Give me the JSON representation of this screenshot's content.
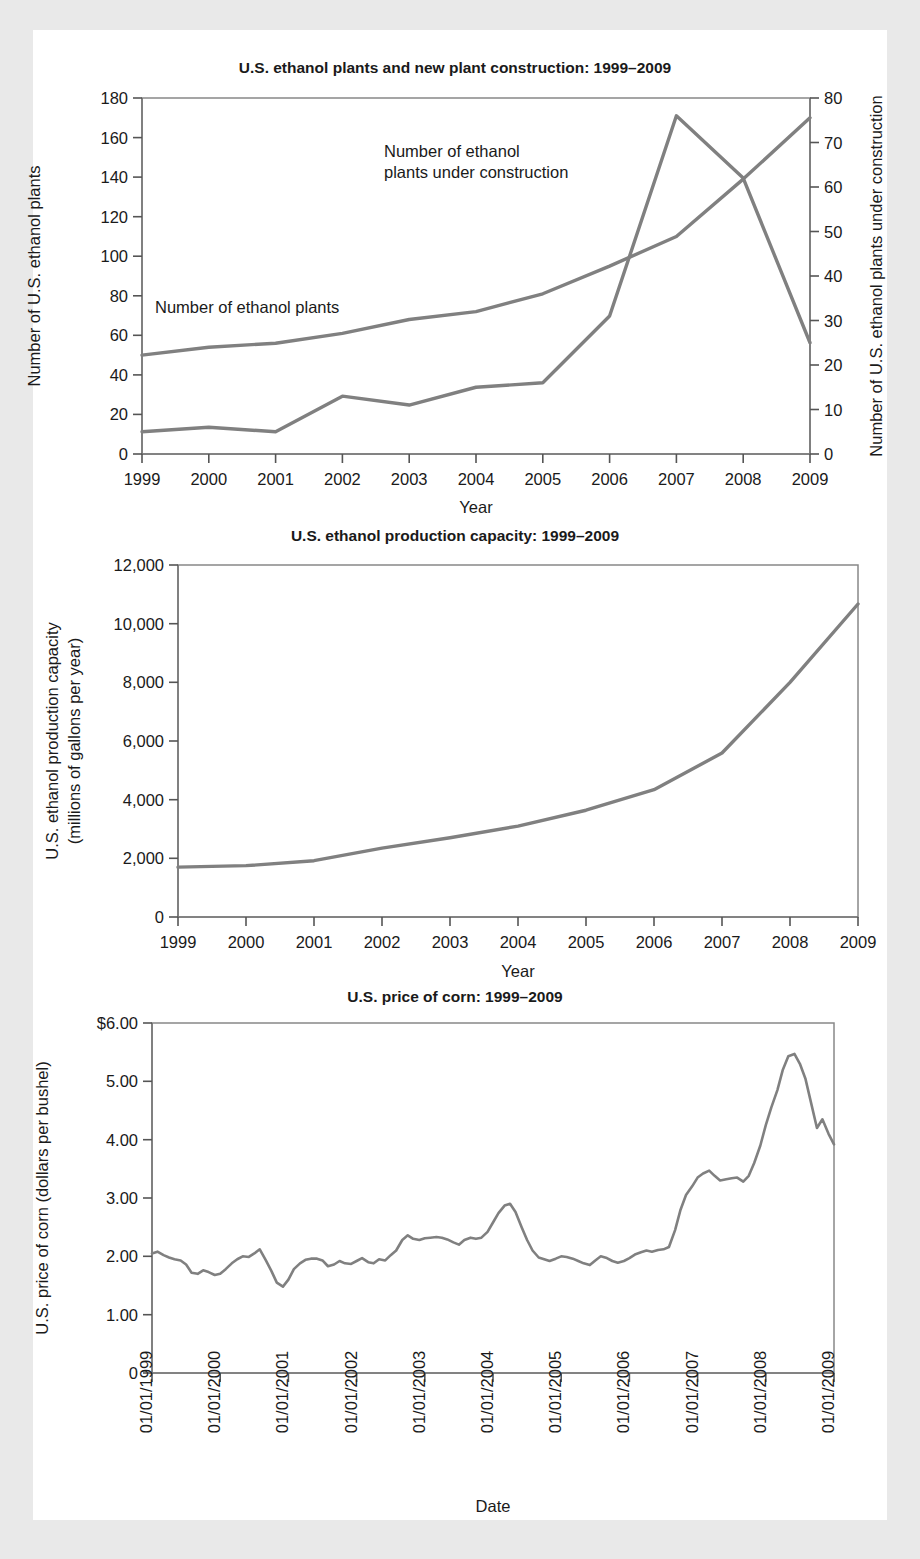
{
  "figure": {
    "background_color": "#e9e9e9",
    "page_color": "#ffffff",
    "line_color": "#808080"
  },
  "chart_data": [
    {
      "id": "ethanol-plants-construction",
      "type": "line",
      "title": "U.S. ethanol plants and new plant construction: 1999–2009",
      "xlabel": "Year",
      "ylabel": "Number of U.S. ethanol plants",
      "y2label": "Number of U.S. ethanol plants under construction",
      "categories": [
        1999,
        2000,
        2001,
        2002,
        2003,
        2004,
        2005,
        2006,
        2007,
        2008,
        2009
      ],
      "xtick_labels": [
        "1999",
        "2000",
        "2001",
        "2002",
        "2003",
        "2004",
        "2005",
        "2006",
        "2007",
        "2008",
        "2009"
      ],
      "ylim": [
        0,
        180
      ],
      "yticks": [
        0,
        20,
        40,
        60,
        80,
        100,
        120,
        140,
        160,
        180
      ],
      "ytick_labels": [
        "0",
        "20",
        "40",
        "60",
        "80",
        "100",
        "120",
        "140",
        "160",
        "180"
      ],
      "y2lim": [
        0,
        80
      ],
      "y2ticks": [
        0,
        10,
        20,
        30,
        40,
        50,
        60,
        70,
        80
      ],
      "y2tick_labels": [
        "0",
        "10",
        "20",
        "30",
        "40",
        "50",
        "60",
        "70",
        "80"
      ],
      "grid": false,
      "legend_position": "inline-annotations",
      "series": [
        {
          "name": "Number of ethanol plants",
          "axis": "left",
          "values": [
            50,
            54,
            56,
            61,
            68,
            72,
            81,
            95,
            110,
            139,
            170
          ]
        },
        {
          "name": "Number of ethanol plants under construction",
          "axis": "right",
          "values": [
            5,
            6,
            5,
            13,
            11,
            15,
            16,
            31,
            76,
            62,
            25
          ]
        }
      ],
      "annotations": [
        {
          "text": "Number of ethanol plants",
          "x": 2000.0,
          "y_left": 76
        },
        {
          "text": "Number of ethanol\nplants under construction",
          "line1": "Number of ethanol",
          "line2": "plants under construction",
          "x": 2003.0,
          "y_left": 152
        }
      ]
    },
    {
      "id": "ethanol-production-capacity",
      "type": "line",
      "title": "U.S. ethanol production capacity: 1999–2009",
      "xlabel": "Year",
      "ylabel": "U.S. ethanol production capacity (millions of gallons per year)",
      "ylabel_line1": "U.S. ethanol production capacity",
      "ylabel_line2": "(millions of gallons per year)",
      "categories": [
        1999,
        2000,
        2001,
        2002,
        2003,
        2004,
        2005,
        2006,
        2007,
        2008,
        2009
      ],
      "xtick_labels": [
        "1999",
        "2000",
        "2001",
        "2002",
        "2003",
        "2004",
        "2005",
        "2006",
        "2007",
        "2008",
        "2009"
      ],
      "ylim": [
        0,
        12000
      ],
      "yticks": [
        0,
        2000,
        4000,
        6000,
        8000,
        10000,
        12000
      ],
      "ytick_labels": [
        "0",
        "2,000",
        "4,000",
        "6,000",
        "8,000",
        "10,000",
        "12,000"
      ],
      "grid": false,
      "values": [
        1700,
        1750,
        1920,
        2350,
        2700,
        3100,
        3640,
        4340,
        5590,
        8000,
        10670
      ]
    },
    {
      "id": "price-of-corn",
      "type": "line",
      "title": "U.S. price of corn: 1999–2009",
      "xlabel": "Date",
      "ylabel": "U.S. price of corn (dollars per bushel)",
      "xtick_labels": [
        "01/01/1999",
        "01/01/2000",
        "01/01/2001",
        "01/01/2002",
        "01/01/2003",
        "01/01/2004",
        "01/01/2005",
        "01/01/2006",
        "01/01/2007",
        "01/01/2008",
        "01/01/2009"
      ],
      "ylim": [
        0,
        6
      ],
      "yticks": [
        0,
        1,
        2,
        3,
        4,
        5,
        6
      ],
      "ytick_labels": [
        "0",
        "1.00",
        "2.00",
        "3.00",
        "4.00",
        "5.00",
        "$6.00"
      ],
      "grid": false,
      "x": [
        1999.0,
        1999.08,
        1999.17,
        1999.25,
        1999.33,
        1999.42,
        1999.5,
        1999.58,
        1999.67,
        1999.75,
        1999.83,
        1999.92,
        2000.0,
        2000.08,
        2000.17,
        2000.25,
        2000.33,
        2000.42,
        2000.5,
        2000.58,
        2000.67,
        2000.75,
        2000.83,
        2000.92,
        2001.0,
        2001.08,
        2001.17,
        2001.25,
        2001.33,
        2001.42,
        2001.5,
        2001.58,
        2001.67,
        2001.75,
        2001.83,
        2001.92,
        2002.0,
        2002.08,
        2002.17,
        2002.25,
        2002.33,
        2002.42,
        2002.5,
        2002.58,
        2002.67,
        2002.75,
        2002.83,
        2002.92,
        2003.0,
        2003.08,
        2003.17,
        2003.25,
        2003.33,
        2003.42,
        2003.5,
        2003.58,
        2003.67,
        2003.75,
        2003.83,
        2003.92,
        2004.0,
        2004.08,
        2004.17,
        2004.25,
        2004.33,
        2004.42,
        2004.5,
        2004.58,
        2004.67,
        2004.75,
        2004.83,
        2004.92,
        2005.0,
        2005.08,
        2005.17,
        2005.25,
        2005.33,
        2005.42,
        2005.5,
        2005.58,
        2005.67,
        2005.75,
        2005.83,
        2005.92,
        2006.0,
        2006.08,
        2006.17,
        2006.25,
        2006.33,
        2006.42,
        2006.5,
        2006.58,
        2006.67,
        2006.75,
        2006.83,
        2006.92,
        2007.0,
        2007.08,
        2007.17,
        2007.25,
        2007.33,
        2007.42,
        2007.5,
        2007.58,
        2007.67,
        2007.75,
        2007.83,
        2007.92,
        2008.0,
        2008.08,
        2008.17,
        2008.25,
        2008.33,
        2008.42,
        2008.5,
        2008.58,
        2008.67,
        2008.75,
        2008.83,
        2008.92,
        2009.0
      ],
      "values": [
        2.05,
        2.08,
        2.02,
        1.98,
        1.95,
        1.93,
        1.86,
        1.72,
        1.7,
        1.76,
        1.73,
        1.68,
        1.7,
        1.78,
        1.88,
        1.95,
        2.0,
        1.99,
        2.05,
        2.12,
        1.93,
        1.75,
        1.55,
        1.48,
        1.6,
        1.78,
        1.88,
        1.94,
        1.96,
        1.96,
        1.93,
        1.83,
        1.86,
        1.92,
        1.88,
        1.87,
        1.92,
        1.97,
        1.9,
        1.88,
        1.95,
        1.93,
        2.02,
        2.1,
        2.28,
        2.36,
        2.3,
        2.28,
        2.31,
        2.32,
        2.33,
        2.32,
        2.29,
        2.24,
        2.2,
        2.28,
        2.32,
        2.3,
        2.32,
        2.42,
        2.58,
        2.74,
        2.87,
        2.9,
        2.76,
        2.5,
        2.28,
        2.1,
        1.98,
        1.95,
        1.92,
        1.96,
        2.0,
        1.99,
        1.96,
        1.92,
        1.88,
        1.85,
        1.93,
        2.0,
        1.97,
        1.92,
        1.89,
        1.92,
        1.97,
        2.03,
        2.07,
        2.1,
        2.08,
        2.11,
        2.12,
        2.16,
        2.45,
        2.8,
        3.05,
        3.2,
        3.35,
        3.42,
        3.47,
        3.38,
        3.3,
        3.32,
        3.34,
        3.35,
        3.28,
        3.38,
        3.6,
        3.9,
        4.25,
        4.55,
        4.85,
        5.2,
        5.43,
        5.47,
        5.3,
        5.05,
        4.6,
        4.2,
        4.35,
        4.1,
        3.92,
        3.95,
        3.98
      ]
    }
  ]
}
